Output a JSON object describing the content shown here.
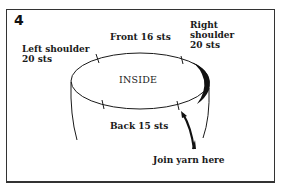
{
  "figure": {
    "step_number": "4",
    "center_label": "INSIDE",
    "labels": {
      "left_shoulder": [
        "Left shoulder",
        "20 sts"
      ],
      "front": "Front 16 sts",
      "right_shoulder": [
        "Right",
        "shoulder",
        "20 sts"
      ],
      "back": "Back 15 sts",
      "join": "Join yarn here"
    },
    "sections": [
      {
        "name": "Left shoulder",
        "stitches": 20
      },
      {
        "name": "Front",
        "stitches": 16
      },
      {
        "name": "Right shoulder",
        "stitches": 20
      },
      {
        "name": "Back",
        "stitches": 15
      }
    ],
    "colors": {
      "ink": "#1a1a1a",
      "background": "#ffffff"
    }
  }
}
